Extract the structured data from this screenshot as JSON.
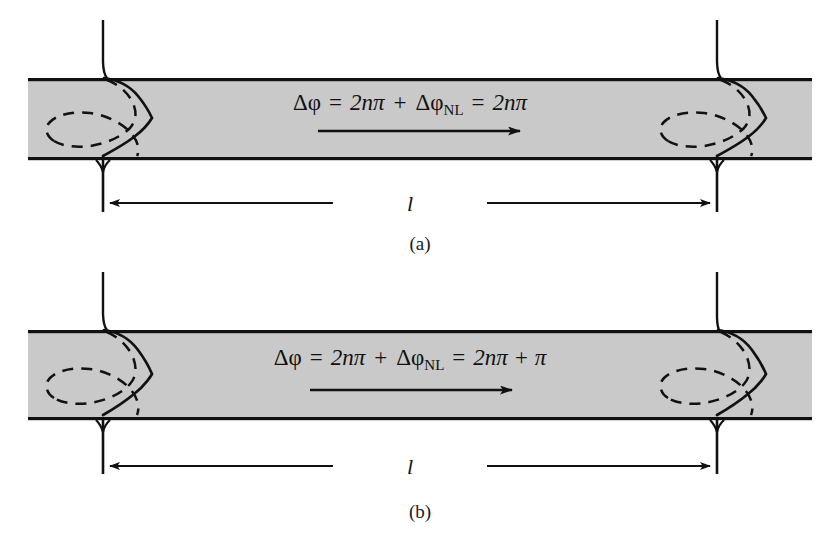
{
  "figure": {
    "title": "",
    "background_color": "#ffffff",
    "medium_fill_color": "#c9c9c9",
    "stroke_color": "#111111",
    "panels": [
      {
        "id": "panel-a",
        "label": "(a)",
        "equation": {
          "full": "Δφ = 2nπ + ΔφNL = 2nπ",
          "delta_phi": "Δφ",
          "equals_1": "=",
          "term_linear": "2nπ",
          "plus": "+",
          "delta_phi_nl_base": "Δφ",
          "delta_phi_nl_sub": "NL",
          "equals_2": "=",
          "result": "2nπ"
        },
        "length_label": "l",
        "propagation_direction": "left-to-right",
        "output_phase_inverted": false
      },
      {
        "id": "panel-b",
        "label": "(b)",
        "equation": {
          "full": "Δφ = 2nπ + ΔφNL = 2nπ + π",
          "delta_phi": "Δφ",
          "equals_1": "=",
          "term_linear": "2nπ",
          "plus": "+",
          "delta_phi_nl_base": "Δφ",
          "delta_phi_nl_sub": "NL",
          "equals_2": "=",
          "result": "2nπ + π"
        },
        "length_label": "l",
        "propagation_direction": "left-to-right",
        "output_phase_inverted": true
      }
    ],
    "geometry": {
      "bar_left_x": 28,
      "bar_right_x": 812,
      "panel_a_bar_top_y": 78,
      "panel_a_bar_bottom_y": 160,
      "panel_b_bar_top_y": 330,
      "panel_b_bar_bottom_y": 420,
      "mirror_left_x": 103,
      "mirror_right_x": 717
    }
  }
}
